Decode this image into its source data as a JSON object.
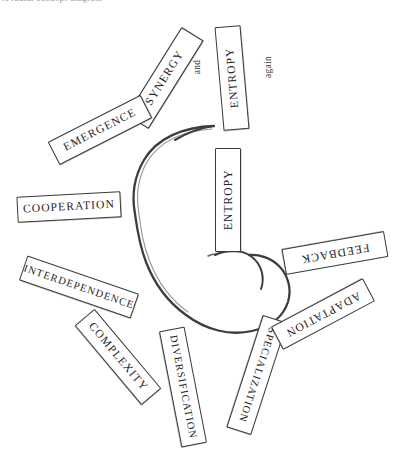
{
  "page": {
    "width": 395,
    "height": 466,
    "background_color": "#ffffff",
    "ink_color": "#2b2b2b",
    "top_caption": "A radial concept diagram"
  },
  "diagram": {
    "center_shape": "open-spiral-circle",
    "outer_labels": [
      {
        "id": "entropy-outer",
        "text": "ENTROPY",
        "angle_deg": -8,
        "orientation": "vertical",
        "size": "tall"
      },
      {
        "id": "synergy",
        "text": "SYNERGY",
        "angle_deg": -58,
        "orientation": "rotated",
        "size": "wide"
      },
      {
        "id": "emergence",
        "text": "EMERGENCE",
        "angle_deg": -27,
        "orientation": "rotated",
        "size": "wide"
      },
      {
        "id": "cooperation",
        "text": "COOPERATION",
        "angle_deg": -3,
        "orientation": "rotated",
        "size": "wide"
      },
      {
        "id": "interdependence",
        "text": "INTERDEPENDENCE",
        "angle_deg": 19,
        "orientation": "rotated",
        "size": "xwide"
      },
      {
        "id": "complexity",
        "text": "COMPLEXITY",
        "angle_deg": 50,
        "orientation": "rotated",
        "size": "wide"
      },
      {
        "id": "diversification",
        "text": "DIVERSIFICATION",
        "angle_deg": 79,
        "orientation": "rotated",
        "size": "xwide"
      },
      {
        "id": "specialization",
        "text": "SPECIALIZATION",
        "angle_deg": 108,
        "orientation": "rotated",
        "size": "xwide"
      },
      {
        "id": "adaptation",
        "text": "ADAPTATION",
        "angle_deg": 152,
        "orientation": "rotated",
        "size": "wide"
      },
      {
        "id": "feedback",
        "text": "FEEDBACK",
        "angle_deg": 170,
        "orientation": "rotated",
        "size": "wide"
      }
    ],
    "inner_labels": [
      {
        "id": "entropy-inner",
        "text": "ENTROPY",
        "orientation": "vertical",
        "size": "tall"
      }
    ],
    "annotations": [
      {
        "id": "and-note",
        "text": "and",
        "angle_deg": -90
      },
      {
        "id": "again-note",
        "text": "again",
        "angle_deg": -90
      }
    ]
  }
}
